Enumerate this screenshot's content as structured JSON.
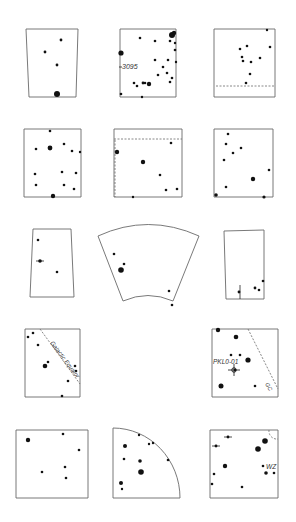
{
  "figure": {
    "background": "#ffffff",
    "ink": "#111111",
    "frame_color": "#6a6a6a"
  },
  "labels": {
    "label_3095": "3095",
    "galactic_equator": "Galactic Equator",
    "pklo": "PKL0-01",
    "gc": "GC",
    "wz": "WZ"
  },
  "panels": [
    {
      "id": "r1c1",
      "shape": "polygon",
      "points": [
        [
          26,
          29
        ],
        [
          78,
          29
        ],
        [
          76,
          97
        ],
        [
          29,
          97
        ]
      ],
      "stars": [
        [
          61,
          40,
          1.4
        ],
        [
          45,
          52,
          1.4
        ],
        [
          57,
          65,
          1.4
        ],
        [
          57,
          94,
          3
        ]
      ]
    },
    {
      "id": "r1c2",
      "shape": "polygon",
      "points": [
        [
          120,
          29
        ],
        [
          176,
          29
        ],
        [
          176,
          97
        ],
        [
          120,
          97
        ]
      ],
      "stars": [
        [
          172,
          35,
          3
        ],
        [
          174,
          33,
          2.2
        ],
        [
          140,
          38,
          1.3
        ],
        [
          155,
          41,
          1.3
        ],
        [
          170,
          41,
          1.3
        ],
        [
          175,
          43,
          1.2
        ],
        [
          175,
          50,
          1.3
        ],
        [
          121,
          53,
          2.6
        ],
        [
          155,
          60,
          1.3
        ],
        [
          168,
          60,
          1.3
        ],
        [
          176,
          62,
          1.2
        ],
        [
          163,
          67,
          1.3
        ],
        [
          158,
          75,
          1.3
        ],
        [
          167,
          73,
          1.3
        ],
        [
          172,
          78,
          1.3
        ],
        [
          170,
          82,
          1.3
        ],
        [
          134,
          83,
          1.3
        ],
        [
          137,
          86,
          1.3
        ],
        [
          143,
          83,
          1.4
        ],
        [
          145,
          83,
          1.3
        ],
        [
          149,
          84,
          2.2
        ],
        [
          121,
          94,
          1.3
        ],
        [
          142,
          97,
          1.2
        ]
      ],
      "text": [
        {
          "bind": "labels.label_3095",
          "x": 122,
          "y": 69,
          "size": 7,
          "marker": [
            119,
            67
          ]
        }
      ]
    },
    {
      "id": "r1c3",
      "shape": "polygon",
      "points": [
        [
          214,
          29
        ],
        [
          275,
          29
        ],
        [
          275,
          97
        ],
        [
          214,
          97
        ]
      ],
      "stars": [
        [
          267,
          30,
          1.2
        ],
        [
          247,
          46,
          1.3
        ],
        [
          240,
          49,
          1.3
        ],
        [
          270,
          47,
          1.3
        ],
        [
          242,
          57,
          1.3
        ],
        [
          243,
          61,
          1.3
        ],
        [
          251,
          62,
          1.3
        ],
        [
          260,
          58,
          1.3
        ],
        [
          250,
          74,
          1.3
        ],
        [
          246,
          83,
          1.3
        ]
      ],
      "dashes": [
        [
          [
            216,
            86
          ],
          [
            275,
            86
          ]
        ]
      ]
    },
    {
      "id": "r2c1",
      "shape": "polygon",
      "points": [
        [
          24,
          129
        ],
        [
          81,
          129
        ],
        [
          81,
          197
        ],
        [
          24,
          197
        ]
      ],
      "stars": [
        [
          50,
          131,
          1.3
        ],
        [
          36,
          149,
          1.3
        ],
        [
          50,
          148,
          2.4
        ],
        [
          64,
          144,
          1.3
        ],
        [
          72,
          151,
          1.3
        ],
        [
          80,
          152,
          1.2
        ],
        [
          35,
          174,
          1.3
        ],
        [
          62,
          172,
          1.3
        ],
        [
          76,
          173,
          1.3
        ],
        [
          36,
          185,
          1.3
        ],
        [
          64,
          185,
          1.3
        ],
        [
          74,
          189,
          1.3
        ],
        [
          53,
          196,
          2.2
        ]
      ]
    },
    {
      "id": "r2c2",
      "shape": "polygon",
      "points": [
        [
          114,
          129
        ],
        [
          182,
          129
        ],
        [
          182,
          197
        ],
        [
          114,
          197
        ]
      ],
      "stars": [
        [
          171,
          143,
          1.3
        ],
        [
          117,
          152,
          2.2
        ],
        [
          143,
          162,
          2.2
        ],
        [
          160,
          175,
          1.3
        ],
        [
          166,
          190,
          1.3
        ],
        [
          177,
          189,
          1.3
        ],
        [
          133,
          197,
          1.2
        ]
      ],
      "dashes": [
        [
          [
            114,
            139
          ],
          [
            182,
            139
          ]
        ],
        [
          [
            115,
            140
          ],
          [
            115,
            197
          ]
        ]
      ]
    },
    {
      "id": "r2c3",
      "shape": "polygon",
      "points": [
        [
          214,
          129
        ],
        [
          273,
          129
        ],
        [
          273,
          197
        ],
        [
          214,
          197
        ]
      ],
      "stars": [
        [
          228,
          134,
          1.3
        ],
        [
          226,
          144,
          1.3
        ],
        [
          241,
          148,
          1.3
        ],
        [
          233,
          153,
          1.3
        ],
        [
          224,
          160,
          1.3
        ],
        [
          269,
          170,
          1.3
        ],
        [
          253,
          179,
          2.2
        ],
        [
          226,
          187,
          1.3
        ],
        [
          216,
          195,
          1.8
        ],
        [
          264,
          197,
          1.6
        ]
      ]
    },
    {
      "id": "r3c1",
      "shape": "polygon",
      "points": [
        [
          33,
          229
        ],
        [
          71,
          229
        ],
        [
          74,
          297
        ],
        [
          30,
          297
        ]
      ],
      "stars": [
        [
          38,
          240,
          1.3
        ],
        [
          40,
          261,
          1.8
        ],
        [
          57,
          272,
          1.3
        ]
      ],
      "ticks": [
        [
          [
            36,
            261
          ],
          [
            44,
            261
          ]
        ]
      ]
    },
    {
      "id": "r3c2",
      "shape": "path",
      "d": "M98,236 Q148,213 199,236 L173,301 Q148,290 123,301 Z",
      "stars": [
        [
          114,
          254,
          1.3
        ],
        [
          124,
          264,
          1.3
        ],
        [
          121,
          270,
          2.8
        ],
        [
          169,
          291,
          1.3
        ],
        [
          172,
          305,
          1.3
        ]
      ]
    },
    {
      "id": "r3c3",
      "shape": "polygon",
      "points": [
        [
          224,
          231
        ],
        [
          264,
          230
        ],
        [
          264,
          299
        ],
        [
          226,
          299
        ]
      ],
      "stars": [
        [
          239,
          292,
          1.4
        ],
        [
          255,
          288,
          1.4
        ],
        [
          259,
          290,
          1.3
        ],
        [
          263,
          281,
          1.3
        ]
      ],
      "ticks": [
        [
          [
            240,
            285
          ],
          [
            240,
            299
          ]
        ]
      ]
    },
    {
      "id": "r4c1",
      "shape": "polygon",
      "points": [
        [
          25,
          329
        ],
        [
          80,
          329
        ],
        [
          80,
          397
        ],
        [
          25,
          397
        ]
      ],
      "stars": [
        [
          28,
          337,
          1.3
        ],
        [
          33,
          333,
          1.3
        ],
        [
          38,
          345,
          1.3
        ],
        [
          48,
          362,
          1.3
        ],
        [
          45,
          366,
          2.3
        ],
        [
          75,
          366,
          1.3
        ],
        [
          76,
          371,
          1.3
        ],
        [
          68,
          381,
          1.3
        ],
        [
          62,
          396,
          1.3
        ]
      ],
      "dashes": [
        [
          [
            40,
            329
          ],
          [
            80,
            384
          ]
        ]
      ],
      "text": [
        {
          "bind": "labels.galactic_equator",
          "x": 50,
          "y": 343,
          "size": 6,
          "rotate": 53
        }
      ]
    },
    {
      "id": "r4c3",
      "shape": "polygon",
      "points": [
        [
          212,
          329
        ],
        [
          278,
          329
        ],
        [
          278,
          397
        ],
        [
          212,
          397
        ]
      ],
      "stars": [
        [
          218,
          330,
          2.2
        ],
        [
          236,
          337,
          2.3
        ],
        [
          240,
          355,
          1.3
        ],
        [
          231,
          355,
          1.3
        ],
        [
          248,
          360,
          2.6
        ],
        [
          235,
          370,
          1.3
        ],
        [
          221,
          386,
          2.5
        ],
        [
          255,
          386,
          1.3
        ]
      ],
      "dashes": [
        [
          [
            248,
            329
          ],
          [
            278,
            389
          ]
        ]
      ],
      "crosshair": [
        234,
        370
      ],
      "text": [
        {
          "bind": "labels.pklo",
          "x": 213,
          "y": 364,
          "size": 6.5
        },
        {
          "bind": "labels.gc",
          "x": 265,
          "y": 384,
          "size": 5.5,
          "rotate": 60
        }
      ]
    },
    {
      "id": "r5c1",
      "shape": "polygon",
      "points": [
        [
          16,
          430
        ],
        [
          88,
          430
        ],
        [
          88,
          498
        ],
        [
          16,
          498
        ]
      ],
      "stars": [
        [
          28,
          440,
          2.2
        ],
        [
          63,
          434,
          1.3
        ],
        [
          79,
          450,
          1.3
        ],
        [
          42,
          472,
          1.3
        ],
        [
          65,
          467,
          1.3
        ],
        [
          66,
          478,
          1.3
        ]
      ]
    },
    {
      "id": "r5c2",
      "shape": "path",
      "d": "M113,428 A67,70 0 0 1 180,498 L113,498 Z",
      "stars": [
        [
          139,
          435,
          1.2
        ],
        [
          149,
          444,
          1.2
        ],
        [
          153,
          443,
          1.2
        ],
        [
          125,
          446,
          2
        ],
        [
          124,
          459,
          1.3
        ],
        [
          140,
          461,
          1.8
        ],
        [
          141,
          472,
          2.8
        ],
        [
          121,
          483,
          2
        ],
        [
          122,
          489,
          1.2
        ],
        [
          168,
          460,
          1.3
        ]
      ]
    },
    {
      "id": "r5c3",
      "shape": "polygon",
      "points": [
        [
          210,
          430
        ],
        [
          278,
          430
        ],
        [
          278,
          498
        ],
        [
          210,
          498
        ]
      ],
      "stars": [
        [
          265,
          441,
          2.8
        ],
        [
          258,
          449,
          2.8
        ],
        [
          228,
          437,
          1.4
        ],
        [
          216,
          446,
          1.4
        ],
        [
          225,
          466,
          2.2
        ],
        [
          263,
          466,
          1.3
        ],
        [
          266,
          473,
          1.8
        ],
        [
          274,
          473,
          1.3
        ],
        [
          214,
          474,
          1.3
        ],
        [
          212,
          484,
          1.3
        ],
        [
          242,
          487,
          1.3
        ]
      ],
      "ticks": [
        [
          [
            224,
            437
          ],
          [
            232,
            437
          ]
        ],
        [
          [
            212,
            446
          ],
          [
            220,
            446
          ]
        ]
      ],
      "arcs": [
        "M269,430 A8,8 0 0 0 278,439"
      ],
      "text": [
        {
          "bind": "labels.wz",
          "x": 266,
          "y": 469,
          "size": 6.5
        }
      ]
    }
  ]
}
